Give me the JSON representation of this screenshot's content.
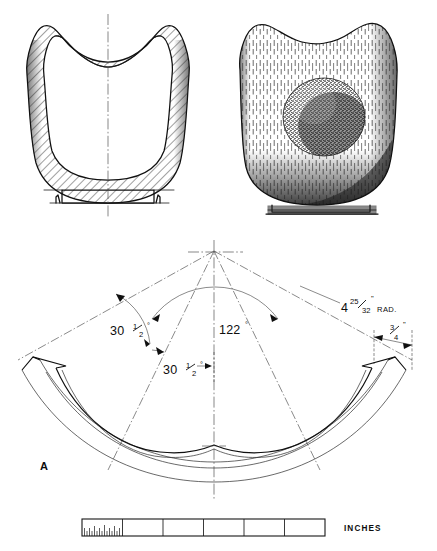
{
  "figure": {
    "type": "technical-drawing",
    "background_color": "#ffffff",
    "ink_color": "#111111"
  },
  "views": {
    "section": {
      "name": "sectional-elevation",
      "hatching": "diagonal-section-hatch",
      "features": [
        "flared-rim",
        "saddle-top-profile",
        "wall-section",
        "base-foot-ring"
      ]
    },
    "pictorial": {
      "name": "pictorial-view",
      "features": [
        "wood-grain-shading",
        "interior-bowl-hollow",
        "foot-ring"
      ],
      "hollow_shading": "stipple-dark"
    },
    "development": {
      "name": "flat-pattern-development",
      "label": "A"
    }
  },
  "dimensions": [
    {
      "id": "angle-left-outer",
      "value": "30",
      "fraction_num": "1",
      "fraction_den": "2",
      "unit": "°",
      "display": "30½°"
    },
    {
      "id": "angle-left-inner",
      "value": "30",
      "fraction_num": "1",
      "fraction_den": "2",
      "unit": "°",
      "display": "30½°"
    },
    {
      "id": "angle-center",
      "value": "122",
      "unit": "°",
      "display": "122°"
    },
    {
      "id": "radius",
      "whole": "4",
      "fraction_num": "25",
      "fraction_den": "32",
      "unit": "\"",
      "suffix": "RAD.",
      "display": "4 25/32\" RAD."
    },
    {
      "id": "width-end",
      "fraction_num": "3",
      "fraction_den": "4",
      "unit": "\"",
      "display": "3/4\""
    }
  ],
  "labels": {
    "part_letter": "A",
    "angle_left_outer_value": "30",
    "angle_left_outer_num": "1",
    "angle_left_outer_den": "2",
    "angle_left_outer_deg": "°",
    "angle_left_inner_value": "30",
    "angle_left_inner_num": "1",
    "angle_left_inner_den": "2",
    "angle_left_inner_deg": "°",
    "angle_center_value": "122",
    "angle_center_deg": "°",
    "radius_whole": "4",
    "radius_num": "25",
    "radius_den": "32",
    "radius_inch": "\"",
    "radius_suffix": "RAD.",
    "end_width_num": "3",
    "end_width_den": "4",
    "end_width_inch": "\""
  },
  "scale_bar": {
    "name": "scale-bar",
    "units_label": "INCHES",
    "divisions": 6,
    "subdivided_division_index": 0,
    "subdivision_ticks": 16
  }
}
